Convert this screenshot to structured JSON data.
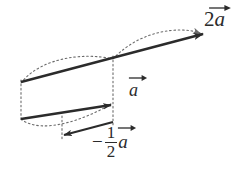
{
  "figure": {
    "background_color": "#ffffff",
    "stroke_color": "#2b2b2b",
    "dotted_color": "#6b6b6b",
    "labels": {
      "double_vector": {
        "scalar": "2",
        "symbol": "a",
        "full": "2a"
      },
      "unit_vector": {
        "scalar": "",
        "symbol": "a",
        "full": "a"
      },
      "half_negative_vector": {
        "sign": "−",
        "numerator": "1",
        "denominator": "2",
        "symbol": "a",
        "full": "-1/2 a"
      }
    },
    "vectors": [
      {
        "name": "2a",
        "start": [
          21,
          82
        ],
        "end": [
          205,
          33
        ],
        "direction": "right-up",
        "length_label": "2a"
      },
      {
        "name": "a",
        "start": [
          21,
          118
        ],
        "end": [
          113,
          104
        ],
        "direction": "right-up",
        "length_label": "a"
      },
      {
        "name": "-1/2 a",
        "start": [
          113,
          122
        ],
        "end": [
          62,
          136
        ],
        "direction": "left-down",
        "length_label": "-1/2 a"
      }
    ],
    "guides": [
      {
        "name": "left-tail-connector",
        "from": [
          21,
          82
        ],
        "to": [
          21,
          118
        ]
      },
      {
        "name": "mid-vertical-connector",
        "from": [
          113,
          58
        ],
        "to": [
          113,
          126
        ]
      },
      {
        "name": "half-drop-connector",
        "from": [
          62,
          118
        ],
        "to": [
          62,
          140
        ]
      }
    ],
    "arcs": [
      {
        "name": "upper-arc-left",
        "from": [
          21,
          82
        ],
        "to": [
          113,
          58
        ]
      },
      {
        "name": "upper-arc-right",
        "from": [
          113,
          58
        ],
        "to": [
          203,
          34
        ]
      },
      {
        "name": "lower-arc",
        "from": [
          21,
          118
        ],
        "to": [
          113,
          104
        ]
      }
    ]
  }
}
